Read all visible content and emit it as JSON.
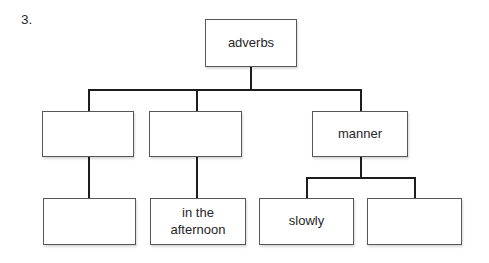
{
  "page": {
    "item_number": "3."
  },
  "tree": {
    "root": {
      "label": "adverbs"
    },
    "level2": [
      {
        "label": ""
      },
      {
        "label": ""
      },
      {
        "label": "manner"
      }
    ],
    "level3": [
      {
        "label": ""
      },
      {
        "label": "in the afternoon"
      },
      {
        "label": "slowly"
      },
      {
        "label": ""
      }
    ]
  },
  "colors": {
    "background": "#ffffff",
    "box_border": "#57575a",
    "connector_line": "#1d1d1d",
    "text": "#262626"
  }
}
